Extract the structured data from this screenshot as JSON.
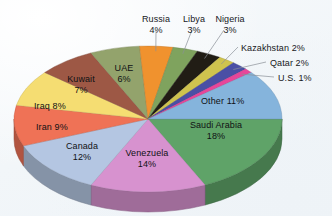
{
  "chart_data": {
    "type": "pie",
    "title": "",
    "subtitle": "",
    "xlabel": "",
    "ylabel": "",
    "legend_position": "none",
    "grid": false,
    "units": "percent",
    "total": 100,
    "categories": [
      "Saudi Arabia",
      "Venezuela",
      "Canada",
      "Iran",
      "Iraq",
      "Kuwait",
      "UAE",
      "Russia",
      "Libya",
      "Nigeria",
      "Kazakhstan",
      "Qatar",
      "U.S.",
      "Other"
    ],
    "values": [
      18,
      14,
      12,
      9,
      8,
      7,
      6,
      4,
      3,
      3,
      2,
      2,
      1,
      11
    ],
    "slices": [
      {
        "name": "Saudi Arabia",
        "value": 18,
        "label": "Saudi Arabia",
        "pct": "18%",
        "color": "#5fa368",
        "label_placement": "inside"
      },
      {
        "name": "Venezuela",
        "value": 14,
        "label": "Venezuela",
        "pct": "14%",
        "color": "#d792cf",
        "label_placement": "inside"
      },
      {
        "name": "Canada",
        "value": 12,
        "label": "Canada",
        "pct": "12%",
        "color": "#b4c6e2",
        "label_placement": "inside"
      },
      {
        "name": "Iran",
        "value": 9,
        "label": "Iran",
        "pct": "9%",
        "color": "#ef7256",
        "label_placement": "inside"
      },
      {
        "name": "Iraq",
        "value": 8,
        "label": "Iraq",
        "pct": "8%",
        "color": "#f5dd72",
        "label_placement": "inside"
      },
      {
        "name": "Kuwait",
        "value": 7,
        "label": "Kuwait",
        "pct": "7%",
        "color": "#9d5845",
        "label_placement": "inside"
      },
      {
        "name": "UAE",
        "value": 6,
        "label": "UAE",
        "pct": "6%",
        "color": "#93a36c",
        "label_placement": "inside"
      },
      {
        "name": "Russia",
        "value": 4,
        "label": "Russia",
        "pct": "4%",
        "color": "#f0922e",
        "label_placement": "outside-top"
      },
      {
        "name": "Libya",
        "value": 3,
        "label": "Libya",
        "pct": "3%",
        "color": "#7fa35e",
        "label_placement": "outside-top"
      },
      {
        "name": "Nigeria",
        "value": 3,
        "label": "Nigeria",
        "pct": "3%",
        "color": "#211d15",
        "label_placement": "outside-top"
      },
      {
        "name": "Kazakhstan",
        "value": 2,
        "label": "Kazakhstan",
        "pct": "2%",
        "color": "#cfc34e",
        "label_placement": "outside-right"
      },
      {
        "name": "Qatar",
        "value": 2,
        "label": "Qatar",
        "pct": "2%",
        "color": "#4a4fa5",
        "label_placement": "outside-right"
      },
      {
        "name": "U.S.",
        "value": 1,
        "label": "U.S.",
        "pct": "1%",
        "color": "#e8459a",
        "label_placement": "outside-right"
      },
      {
        "name": "Other",
        "value": 11,
        "label": "Other",
        "pct": "11%",
        "color": "#85b4dc",
        "label_placement": "inside"
      }
    ],
    "labels_inside": [
      {
        "name": "saudi-arabia",
        "text": "Saudi Arabia",
        "pct": "18%"
      },
      {
        "name": "venezuela",
        "text": "Venezuela",
        "pct": "14%"
      },
      {
        "name": "canada",
        "text": "Canada",
        "pct": "12%"
      },
      {
        "name": "iran",
        "text": "Iran",
        "pct": "9%"
      },
      {
        "name": "iraq",
        "text": "Iraq",
        "pct": "8%"
      },
      {
        "name": "kuwait",
        "text": "Kuwait",
        "pct": "7%"
      },
      {
        "name": "uae",
        "text": "UAE",
        "pct": "6%"
      },
      {
        "name": "other",
        "text": "Other",
        "pct": "11%"
      }
    ],
    "labels_outside": [
      {
        "name": "russia",
        "text": "Russia",
        "pct": "4%"
      },
      {
        "name": "libya",
        "text": "Libya",
        "pct": "3%"
      },
      {
        "name": "nigeria",
        "text": "Nigeria",
        "pct": "3%"
      },
      {
        "name": "kazakhstan",
        "text": "Kazakhstan 2%",
        "pct": "2%"
      },
      {
        "name": "qatar",
        "text": "Qatar 2%",
        "pct": "2%"
      },
      {
        "name": "us",
        "text": "U.S. 1%",
        "pct": "1%"
      }
    ],
    "background_color": "#f4f7fa",
    "text_color": "#16171b",
    "leader_line_color": "#8a8f96"
  }
}
